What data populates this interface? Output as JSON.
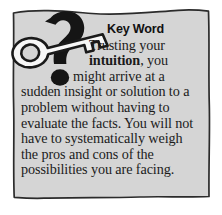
{
  "callout": {
    "kind": "key-word-sidebar",
    "heading": "Key Word",
    "body": "Trusting your intuition, you might arrive at a sudden insight or solution to a problem without having to evaluate the facts. You will not have to systematically weigh the pros and cons of the possibilities you are facing.",
    "lines": [
      "Trusting your",
      "intuition, you",
      "might arrive at a",
      "sudden insight or solution to",
      "a problem without having to",
      "evaluate the facts. You will",
      "not have to systematically",
      "weigh the pros and cons of",
      "the possibilities you are",
      "facing."
    ],
    "emphasis_word": "intuition"
  },
  "icons": {
    "key": "key-icon",
    "question_mark": "question-mark-icon",
    "question_mark_dot": "question-mark-dot-icon"
  },
  "colors": {
    "panel_fill": "#d5d5d5",
    "panel_border": "#2b2b2b",
    "page_background": "#ffffff",
    "text": "#1b1b1b",
    "heading": "#111111",
    "key_fill": "#f7f7f7",
    "key_outline": "#1a1a1a",
    "question_mark_fill": "#151515"
  }
}
